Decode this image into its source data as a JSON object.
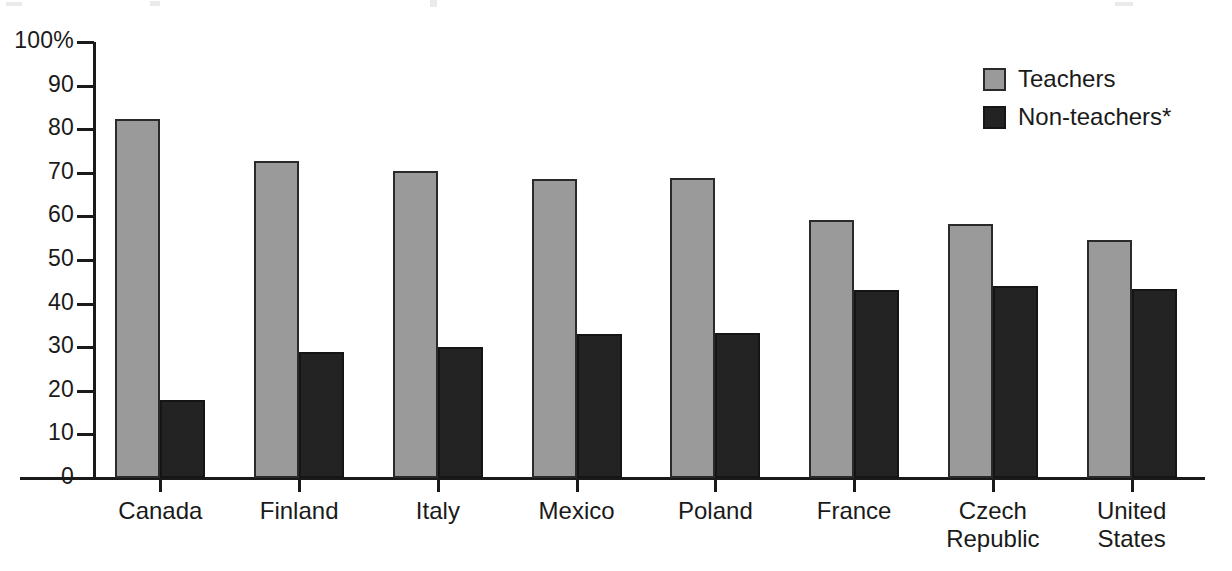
{
  "chart_data": {
    "type": "bar",
    "title": "",
    "xlabel": "",
    "ylabel": "",
    "ylim": [
      0,
      100
    ],
    "grid": false,
    "legend_position": "top-right",
    "y_ticks": [
      "0",
      "10",
      "20",
      "30",
      "40",
      "50",
      "60",
      "70",
      "80",
      "90",
      "100%"
    ],
    "y_tick_values": [
      0,
      10,
      20,
      30,
      40,
      50,
      60,
      70,
      80,
      90,
      100
    ],
    "categories": [
      "Canada",
      "Finland",
      "Italy",
      "Mexico",
      "Poland",
      "France",
      "Czech\nRepublic",
      "United\nStates"
    ],
    "series": [
      {
        "name": "Teachers",
        "color": "#9a9a9a",
        "values": [
          82.3,
          72.8,
          70.5,
          68.6,
          68.7,
          59.1,
          58.3,
          54.5
        ]
      },
      {
        "name": "Non-teachers*",
        "color": "#232323",
        "values": [
          17.9,
          29.0,
          30.0,
          33.0,
          33.2,
          43.2,
          44.1,
          43.3
        ]
      }
    ]
  },
  "legend": {
    "items": [
      {
        "label": "Teachers",
        "swatch": "teachers"
      },
      {
        "label": "Non-teachers*",
        "swatch": "nonteachers"
      }
    ]
  }
}
